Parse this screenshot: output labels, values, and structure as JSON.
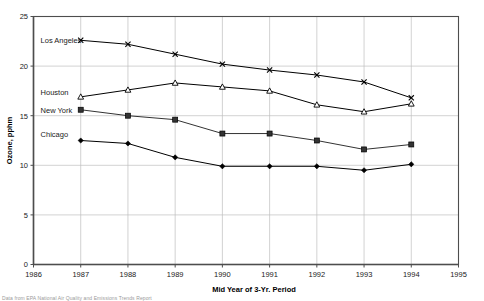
{
  "chart_data": {
    "type": "line",
    "title": "",
    "xlabel": "Mid Year of 3-Yr. Period",
    "ylabel": "Ozone, pphm",
    "x": [
      1987,
      1988,
      1989,
      1990,
      1991,
      1992,
      1993,
      1994
    ],
    "xlim": [
      1986,
      1995
    ],
    "ylim": [
      0,
      25
    ],
    "xticks": [
      1986,
      1987,
      1988,
      1989,
      1990,
      1991,
      1992,
      1993,
      1994,
      1995
    ],
    "yticks": [
      0,
      5,
      10,
      15,
      20,
      25
    ],
    "grid": true,
    "legend_position": "inline-left-of-first-point",
    "series": [
      {
        "name": "Los Angeles",
        "marker": "x",
        "color": "#000000",
        "label_x": 1986.15,
        "label_y": 22.6,
        "values": [
          22.6,
          22.2,
          21.2,
          20.2,
          19.6,
          19.1,
          18.4,
          16.8
        ]
      },
      {
        "name": "Houston",
        "marker": "triangle-open",
        "color": "#000000",
        "label_x": 1986.15,
        "label_y": 17.3,
        "values": [
          16.9,
          17.6,
          18.3,
          17.9,
          17.5,
          16.1,
          15.4,
          16.2
        ]
      },
      {
        "name": "New York",
        "marker": "square",
        "color": "#333333",
        "label_x": 1986.15,
        "label_y": 15.5,
        "values": [
          15.6,
          15.0,
          14.6,
          13.2,
          13.2,
          12.5,
          11.6,
          12.1
        ]
      },
      {
        "name": "Chicago",
        "marker": "diamond",
        "color": "#000000",
        "label_x": 1986.15,
        "label_y": 13.1,
        "values": [
          12.5,
          12.2,
          10.8,
          9.9,
          9.9,
          9.9,
          9.5,
          10.1
        ]
      }
    ]
  },
  "footnote": "Data from EPA National Air Quality and Emissions Trends Report"
}
